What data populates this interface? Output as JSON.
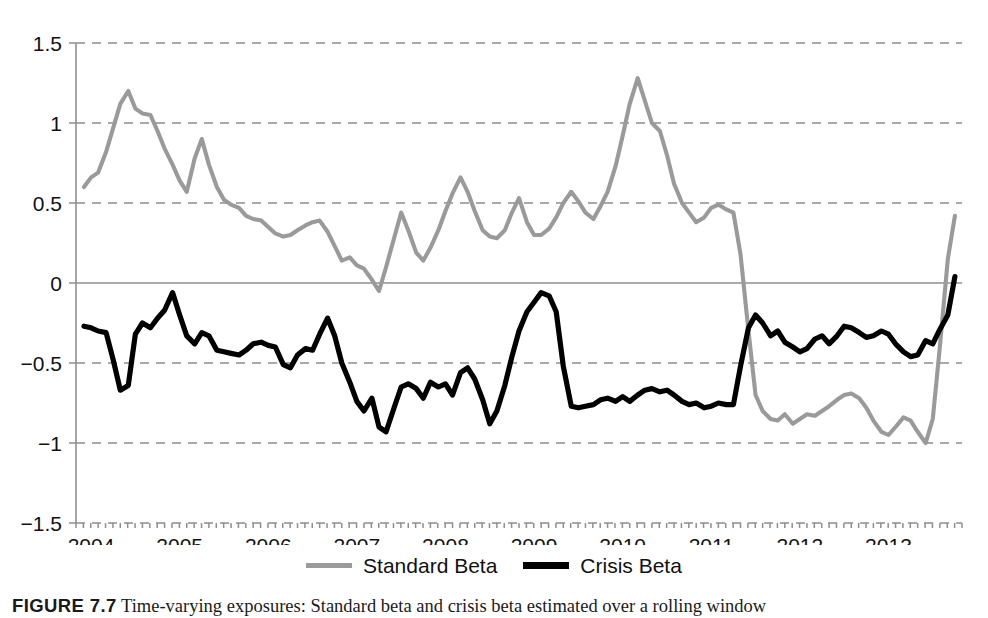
{
  "figure": {
    "caption_number": "FIGURE 7.7",
    "caption_text": "Time-varying exposures: Standard beta and crisis beta estimated over a rolling window"
  },
  "legend": {
    "position": "bottom-center",
    "entries": [
      {
        "label": "Standard Beta",
        "color": "#9a9a9a",
        "swatch": "line-swatch-standard"
      },
      {
        "label": "Crisis Beta",
        "color": "#000000",
        "swatch": "line-swatch-crisis"
      }
    ]
  },
  "axes": {
    "y_ticks": [
      "1.5",
      "1",
      "0.5",
      "0",
      "-0.5",
      "-1",
      "-1.5"
    ],
    "y_tick_values": [
      1.5,
      1,
      0.5,
      0,
      -0.5,
      -1,
      -1.5
    ],
    "x_ticks": [
      "2004",
      "2005",
      "2006",
      "2007",
      "2008",
      "2009",
      "2010",
      "2011",
      "2012",
      "2013"
    ],
    "x_tick_values": [
      2004,
      2005,
      2006,
      2007,
      2008,
      2009,
      2010,
      2011,
      2012,
      2013
    ],
    "grid": "horizontal-dashed",
    "zero_line": true
  },
  "chart_data": {
    "type": "line",
    "title": "",
    "subtitle": "",
    "xlabel": "",
    "ylabel": "",
    "xlim": [
      2003.83,
      2013.83
    ],
    "ylim": [
      -1.5,
      1.5
    ],
    "grid": true,
    "legend_position": "bottom-center",
    "categories": [
      "2004",
      "2005",
      "2006",
      "2007",
      "2008",
      "2009",
      "2010",
      "2011",
      "2012",
      "2013"
    ],
    "series": [
      {
        "name": "Standard Beta",
        "color": "#9a9a9a",
        "x": [
          2003.92,
          2004.0,
          2004.08,
          2004.17,
          2004.25,
          2004.33,
          2004.42,
          2004.5,
          2004.58,
          2004.67,
          2004.75,
          2004.83,
          2004.92,
          2005.0,
          2005.08,
          2005.17,
          2005.25,
          2005.33,
          2005.42,
          2005.5,
          2005.58,
          2005.67,
          2005.75,
          2005.83,
          2005.92,
          2006.0,
          2006.08,
          2006.17,
          2006.25,
          2006.33,
          2006.42,
          2006.5,
          2006.58,
          2006.67,
          2006.75,
          2006.83,
          2006.92,
          2007.0,
          2007.08,
          2007.17,
          2007.25,
          2007.33,
          2007.42,
          2007.5,
          2007.58,
          2007.67,
          2007.75,
          2007.83,
          2007.92,
          2008.0,
          2008.08,
          2008.17,
          2008.25,
          2008.33,
          2008.42,
          2008.5,
          2008.58,
          2008.67,
          2008.75,
          2008.83,
          2008.92,
          2009.0,
          2009.08,
          2009.17,
          2009.25,
          2009.33,
          2009.42,
          2009.5,
          2009.58,
          2009.67,
          2009.75,
          2009.83,
          2009.92,
          2010.0,
          2010.08,
          2010.17,
          2010.25,
          2010.33,
          2010.42,
          2010.5,
          2010.58,
          2010.67,
          2010.75,
          2010.83,
          2010.92,
          2011.0,
          2011.08,
          2011.17,
          2011.25,
          2011.33,
          2011.42,
          2011.5,
          2011.58,
          2011.67,
          2011.75,
          2011.83,
          2011.92,
          2012.0,
          2012.08,
          2012.17,
          2012.25,
          2012.33,
          2012.42,
          2012.5,
          2012.58,
          2012.67,
          2012.75,
          2012.83,
          2012.92,
          2013.0,
          2013.08,
          2013.17,
          2013.25,
          2013.33,
          2013.42,
          2013.5,
          2013.58,
          2013.67,
          2013.75
        ],
        "values": [
          0.6,
          0.66,
          0.69,
          0.82,
          0.97,
          1.12,
          1.2,
          1.09,
          1.06,
          1.05,
          0.95,
          0.84,
          0.74,
          0.64,
          0.57,
          0.78,
          0.9,
          0.74,
          0.6,
          0.52,
          0.49,
          0.47,
          0.42,
          0.4,
          0.39,
          0.35,
          0.31,
          0.29,
          0.3,
          0.33,
          0.36,
          0.38,
          0.39,
          0.32,
          0.23,
          0.14,
          0.16,
          0.11,
          0.09,
          0.02,
          -0.05,
          0.1,
          0.28,
          0.44,
          0.33,
          0.19,
          0.14,
          0.22,
          0.33,
          0.45,
          0.56,
          0.66,
          0.57,
          0.45,
          0.33,
          0.29,
          0.28,
          0.33,
          0.44,
          0.53,
          0.38,
          0.3,
          0.3,
          0.34,
          0.41,
          0.5,
          0.57,
          0.51,
          0.44,
          0.4,
          0.48,
          0.57,
          0.73,
          0.92,
          1.12,
          1.28,
          1.14,
          1.0,
          0.95,
          0.8,
          0.62,
          0.5,
          0.44,
          0.38,
          0.41,
          0.47,
          0.49,
          0.46,
          0.44,
          0.18,
          -0.3,
          -0.7,
          -0.8,
          -0.85,
          -0.86,
          -0.82,
          -0.88,
          -0.85,
          -0.82,
          -0.83,
          -0.8,
          -0.77,
          -0.73,
          -0.7,
          -0.69,
          -0.72,
          -0.78,
          -0.86,
          -0.93,
          -0.95,
          -0.9,
          -0.84,
          -0.86,
          -0.93,
          -1.0,
          -0.85,
          -0.4,
          0.15,
          0.42
        ],
        "note": "Standard beta: starts ~0.6, peaks 1.20 mid-2004 and 1.28 in late 2007, collapses below zero mid-2008, stays near -0.8 to -1.0 through 2010, rebounds to ~0.6 in 2011, declines through 2012, falls to -0.6 in 2013, ends near -0.2"
      },
      {
        "name": "Crisis Beta",
        "color": "#000000",
        "x": [
          2003.92,
          2004.0,
          2004.08,
          2004.17,
          2004.25,
          2004.33,
          2004.42,
          2004.5,
          2004.58,
          2004.67,
          2004.75,
          2004.83,
          2004.92,
          2005.0,
          2005.08,
          2005.17,
          2005.25,
          2005.33,
          2005.42,
          2005.5,
          2005.58,
          2005.67,
          2005.75,
          2005.83,
          2005.92,
          2006.0,
          2006.08,
          2006.17,
          2006.25,
          2006.33,
          2006.42,
          2006.5,
          2006.58,
          2006.67,
          2006.75,
          2006.83,
          2006.92,
          2007.0,
          2007.08,
          2007.17,
          2007.25,
          2007.33,
          2007.42,
          2007.5,
          2007.58,
          2007.67,
          2007.75,
          2007.83,
          2007.92,
          2008.0,
          2008.08,
          2008.17,
          2008.25,
          2008.33,
          2008.42,
          2008.5,
          2008.58,
          2008.67,
          2008.75,
          2008.83,
          2008.92,
          2009.0,
          2009.08,
          2009.17,
          2009.25,
          2009.33,
          2009.42,
          2009.5,
          2009.58,
          2009.67,
          2009.75,
          2009.83,
          2009.92,
          2010.0,
          2010.08,
          2010.17,
          2010.25,
          2010.33,
          2010.42,
          2010.5,
          2010.58,
          2010.67,
          2010.75,
          2010.83,
          2010.92,
          2011.0,
          2011.08,
          2011.17,
          2011.25,
          2011.33,
          2011.42,
          2011.5,
          2011.58,
          2011.67,
          2011.75,
          2011.83,
          2011.92,
          2012.0,
          2012.08,
          2012.17,
          2012.25,
          2012.33,
          2012.42,
          2012.5,
          2012.58,
          2012.67,
          2012.75,
          2012.83,
          2012.92,
          2013.0,
          2013.08,
          2013.17,
          2013.25,
          2013.33,
          2013.42,
          2013.5,
          2013.58,
          2013.67,
          2013.75
        ],
        "values": [
          -0.27,
          -0.28,
          -0.3,
          -0.31,
          -0.48,
          -0.67,
          -0.64,
          -0.32,
          -0.25,
          -0.28,
          -0.22,
          -0.17,
          -0.06,
          -0.2,
          -0.33,
          -0.38,
          -0.31,
          -0.33,
          -0.42,
          -0.43,
          -0.44,
          -0.45,
          -0.42,
          -0.38,
          -0.37,
          -0.39,
          -0.4,
          -0.51,
          -0.53,
          -0.45,
          -0.41,
          -0.42,
          -0.32,
          -0.22,
          -0.33,
          -0.5,
          -0.62,
          -0.74,
          -0.8,
          -0.72,
          -0.9,
          -0.93,
          -0.78,
          -0.65,
          -0.63,
          -0.66,
          -0.72,
          -0.62,
          -0.65,
          -0.63,
          -0.7,
          -0.56,
          -0.53,
          -0.6,
          -0.73,
          -0.88,
          -0.8,
          -0.64,
          -0.46,
          -0.3,
          -0.18,
          -0.12,
          -0.06,
          -0.08,
          -0.18,
          -0.52,
          -0.77,
          -0.78,
          -0.77,
          -0.76,
          -0.73,
          -0.72,
          -0.74,
          -0.71,
          -0.74,
          -0.7,
          -0.67,
          -0.66,
          -0.68,
          -0.67,
          -0.7,
          -0.74,
          -0.76,
          -0.75,
          -0.78,
          -0.77,
          -0.75,
          -0.76,
          -0.76,
          -0.52,
          -0.28,
          -0.2,
          -0.25,
          -0.33,
          -0.3,
          -0.37,
          -0.4,
          -0.43,
          -0.41,
          -0.35,
          -0.33,
          -0.38,
          -0.33,
          -0.27,
          -0.28,
          -0.31,
          -0.34,
          -0.33,
          -0.3,
          -0.32,
          -0.38,
          -0.43,
          -0.46,
          -0.45,
          -0.36,
          -0.38,
          -0.29,
          -0.2,
          0.04
        ],
        "note": "Crisis beta: starts ~-0.27, dips to -0.67 in early 2004, oscillates between -0.2 and -0.9 through 2008, rises to -0.06 mid-2008 then drops to a flat -0.75 plateau through 2010, rebounds to about -0.2 in 2011, drifts between -0.25 and -0.46, ends slightly positive at 0.04"
      }
    ]
  }
}
